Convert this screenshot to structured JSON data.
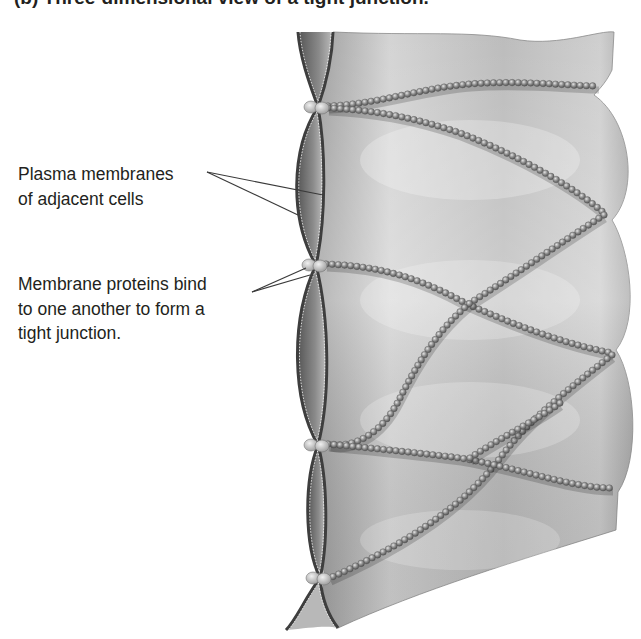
{
  "figure": {
    "title": "(b) Three-dimensional view of a tight junction.",
    "labels": [
      {
        "id": "membranes",
        "lines": [
          "Plasma membranes",
          "of adjacent cells"
        ]
      },
      {
        "id": "proteins",
        "lines": [
          "Membrane proteins bind",
          "to one another to form a",
          "tight junction."
        ]
      }
    ],
    "colors": {
      "background": "#ffffff",
      "text": "#231f20",
      "membrane_fill": "#c4c4c4",
      "membrane_edge": "#4a4a4a",
      "protein_bead": "#8c8c8c",
      "leader_line": "#3a3a3a"
    }
  }
}
